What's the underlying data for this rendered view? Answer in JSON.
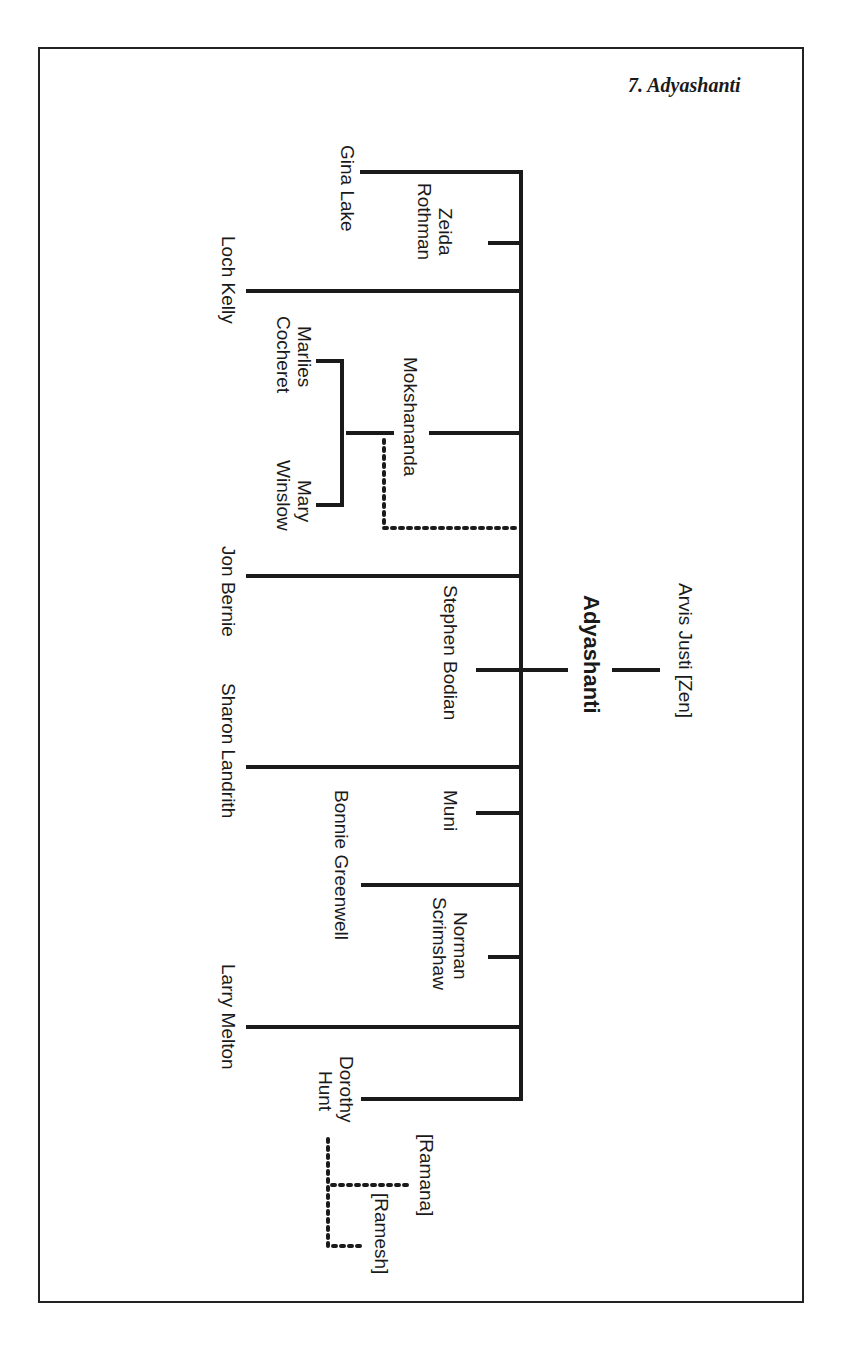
{
  "title": "7. Adyashanti",
  "root": {
    "name": "Adyashanti"
  },
  "teacher": {
    "name": "Arvis Justi [Zen]"
  },
  "students": [
    {
      "name": "Gina Lake"
    },
    {
      "name": "Zeida Rothman",
      "line1": "Zeida",
      "line2": "Rothman"
    },
    {
      "name": "Loch Kelly"
    },
    {
      "name": "Mokshananda"
    },
    {
      "name": "Marlies Cocheret",
      "line1": "Marlies",
      "line2": "Cocheret"
    },
    {
      "name": "Mary Winslow",
      "line1": "Mary",
      "line2": "Winslow"
    },
    {
      "name": "Jon Bernie"
    },
    {
      "name": "Stephen Bodian"
    },
    {
      "name": "Sharon Landrith"
    },
    {
      "name": "Muni"
    },
    {
      "name": "Bonnie Greenwell"
    },
    {
      "name": "Norman Scrimshaw",
      "line1": "Norman",
      "line2": "Scrimshaw"
    },
    {
      "name": "Larry Melton"
    },
    {
      "name": "Dorothy Hunt",
      "line1": "Dorothy",
      "line2": "Hunt"
    }
  ],
  "other_influences": [
    {
      "name": "[Ramana]"
    },
    {
      "name": "[Ramesh]"
    }
  ],
  "colors": {
    "line": "#1a1a1a",
    "frame": "#222222",
    "background": "#ffffff"
  }
}
